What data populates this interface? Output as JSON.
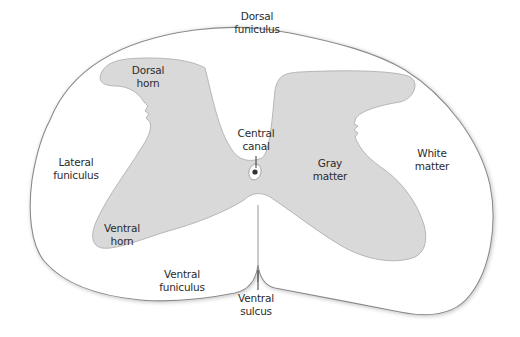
{
  "diagram": {
    "colors": {
      "background": "#ffffff",
      "white_matter_fill": "#ffffff",
      "outline": "#8a8a8a",
      "gray_matter_fill": "#d9d9d9",
      "gray_matter_stroke": "#a8a8a8",
      "text": "#2b2b2b",
      "canal_dot": "#333333"
    },
    "labels": {
      "dorsal_funiculus": {
        "line1": "Dorsal",
        "line2": "funiculus"
      },
      "dorsal_horn": {
        "line1": "Dorsal",
        "line2": "horn"
      },
      "central_canal": {
        "line1": "Central",
        "line2": "canal"
      },
      "lateral_funiculus": {
        "line1": "Lateral",
        "line2": "funiculus"
      },
      "gray_matter": {
        "line1": "Gray",
        "line2": "matter"
      },
      "white_matter": {
        "line1": "White",
        "line2": "matter"
      },
      "ventral_horn": {
        "line1": "Ventral",
        "line2": "horn"
      },
      "ventral_funiculus": {
        "line1": "Ventral",
        "line2": "funiculus"
      },
      "ventral_sulcus": {
        "line1": "Ventral",
        "line2": "sulcus"
      }
    }
  }
}
